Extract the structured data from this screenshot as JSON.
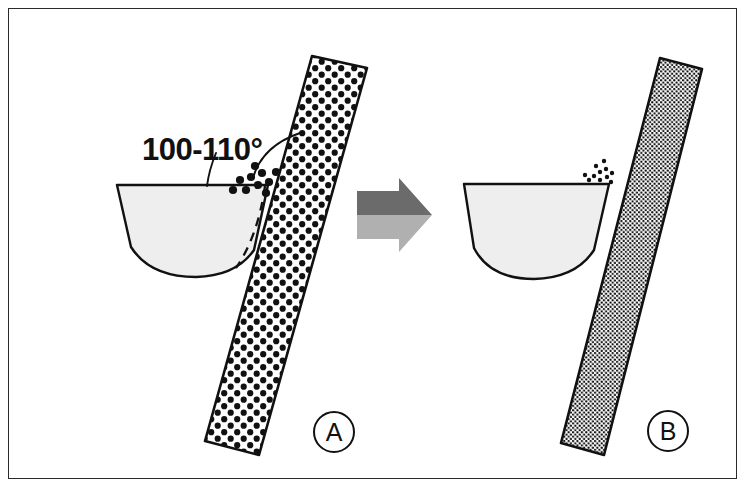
{
  "figure": {
    "type": "diagram",
    "background_color": "#ffffff",
    "frame_color": "#2b2b2b"
  },
  "annotations": {
    "angle_label": "100-110°",
    "angle_value_min": 100,
    "angle_value_max": 110,
    "angle_unit": "degrees"
  },
  "panels": [
    {
      "id": "A",
      "label": "A",
      "column": {
        "name": "coarse-dotted-column",
        "fill_pattern": "coarse-dots",
        "dot_spacing_px": 13,
        "dot_radius_px": 3.1,
        "dot_color": "#111111",
        "background_color": "#ffffff",
        "outline_color": "#111111"
      },
      "bowl": {
        "name": "meniscus-bowl",
        "fill_color": "#eeeeee",
        "outline_color": "#111111",
        "has_dashed_arc": true,
        "dashed_arc_color": "#111111"
      },
      "loose_dots": {
        "count": 10,
        "style": "coarse-scattered",
        "color": "#111111"
      },
      "has_angle_annotation": true
    },
    {
      "id": "B",
      "label": "B",
      "column": {
        "name": "fine-dotted-column",
        "fill_pattern": "fine-dots",
        "dot_spacing_px": 4.4,
        "dot_radius_px": 1.15,
        "dot_color": "#111111",
        "background_color": "#ffffff",
        "outline_color": "#111111"
      },
      "bowl": {
        "name": "meniscus-bowl",
        "fill_color": "#eeeeee",
        "outline_color": "#111111",
        "has_dashed_arc": false
      },
      "loose_dots": {
        "count": 11,
        "style": "fine-clustered",
        "color": "#111111"
      },
      "has_angle_annotation": false
    }
  ],
  "arrow": {
    "name": "transition-arrow",
    "direction": "right",
    "top_color": "#6b6b6b",
    "bottom_color": "#b0b0b0"
  },
  "colors": {
    "ink": "#111111",
    "frame": "#2b2b2b",
    "bowl_fill": "#eeeeee",
    "arrow_dark": "#6b6b6b",
    "arrow_light": "#b0b0b0"
  }
}
